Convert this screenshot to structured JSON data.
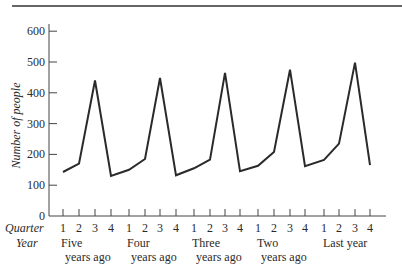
{
  "chart_data": {
    "type": "line",
    "title": "",
    "xlabel": "Quarter / Year",
    "ylabel": "Number of people",
    "ylim": [
      0,
      600
    ],
    "yticks": [
      0,
      100,
      200,
      300,
      400,
      500,
      600
    ],
    "grid": false,
    "legend": null,
    "row_labels": {
      "quarter": "Quarter",
      "year": "Year"
    },
    "categories": [
      "1",
      "2",
      "3",
      "4",
      "1",
      "2",
      "3",
      "4",
      "1",
      "2",
      "3",
      "4",
      "1",
      "2",
      "3",
      "4",
      "1",
      "2",
      "3",
      "4"
    ],
    "year_groups": [
      {
        "line1": "Five",
        "line2": "years ago"
      },
      {
        "line1": "Four",
        "line2": "years ago"
      },
      {
        "line1": "Three",
        "line2": "years ago"
      },
      {
        "line1": "Two",
        "line2": "years ago"
      },
      {
        "line1": "Last year",
        "line2": ""
      }
    ],
    "series": [
      {
        "name": "Number of people",
        "values": [
          143,
          170,
          440,
          130,
          150,
          185,
          448,
          132,
          155,
          183,
          465,
          145,
          163,
          208,
          475,
          162,
          182,
          235,
          498,
          165
        ]
      }
    ]
  }
}
